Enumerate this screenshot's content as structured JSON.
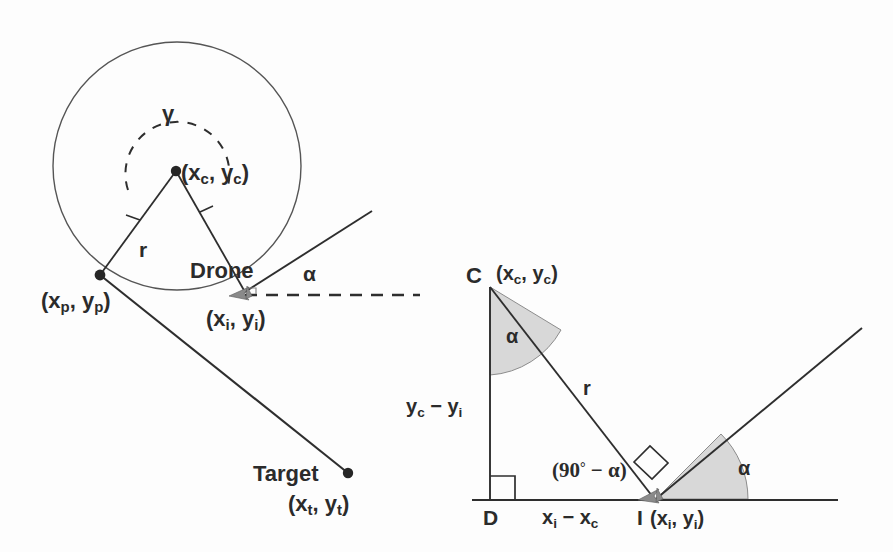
{
  "figure": {
    "background_color": "#fdfdfd",
    "line_color": "#2e2e2e",
    "shade_color": "#d8d8d8"
  },
  "left_diagram": {
    "name": "turn-circle-geometry",
    "labels": {
      "gamma": "γ",
      "center_point": "(x",
      "center_point_sub1": "c",
      "center_point_mid": ", y",
      "center_point_sub2": "c",
      "center_point_end": ")",
      "radius": "r",
      "drone": "Drone",
      "alpha": "α",
      "pivot_point": "(x",
      "pivot_sub1": "p",
      "pivot_mid": ", y",
      "pivot_sub2": "p",
      "pivot_end": ")",
      "intercept_point": "(x",
      "intercept_sub1": "i",
      "intercept_mid": ", y",
      "intercept_sub2": "i",
      "intercept_end": ")",
      "target": "Target",
      "target_point": "(x",
      "target_sub1": "t",
      "target_mid": ", y",
      "target_sub2": "t",
      "target_end": ")"
    },
    "geometry": {
      "circle_center": [
        177,
        166
      ],
      "circle_radius": 124,
      "center_dot": [
        176,
        171
      ],
      "pivot_dot": [
        100,
        275
      ],
      "drone_dot": [
        245,
        292
      ],
      "target_dot": [
        348,
        473
      ],
      "heading_ray_end": [
        372,
        211
      ],
      "dashed_heading_end": [
        420,
        295
      ],
      "gamma_arc_radius": 52
    }
  },
  "right_diagram": {
    "name": "right-triangle-geometry",
    "labels": {
      "vertex_c": "C",
      "center_point": "(x",
      "center_point_sub1": "c",
      "center_point_mid": ", y",
      "center_point_sub2": "c",
      "center_point_end": ")",
      "alpha_top": "α",
      "alpha_bottom": "α",
      "radius": "r",
      "vertical_side": "y",
      "vertical_sub1": "c",
      "vertical_mid": " − y",
      "vertical_sub2": "i",
      "angle_expr_open": "(90",
      "angle_expr_deg": "°",
      "angle_expr_rest": " − α)",
      "vertex_d": "D",
      "horizontal_side": "x",
      "horizontal_sub1": "i",
      "horizontal_mid": " − x",
      "horizontal_sub2": "c",
      "vertex_i": "I",
      "intercept_point": "(x",
      "intercept_sub1": "i",
      "intercept_mid": ", y",
      "intercept_sub2": "i",
      "intercept_end": ")"
    },
    "geometry": {
      "vertex_c": [
        490,
        287
      ],
      "vertex_d": [
        490,
        500
      ],
      "vertex_i": [
        656,
        499
      ],
      "baseline_start": [
        472,
        500
      ],
      "baseline_end": [
        838,
        500
      ],
      "ray_end": [
        862,
        328
      ],
      "alpha_top_arc_radius": 88,
      "alpha_bottom_arc_radius": 92
    }
  }
}
